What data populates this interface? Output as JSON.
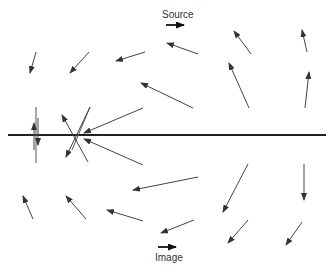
{
  "diagram": {
    "labels": {
      "source": "Source",
      "image": "Image"
    },
    "colors": {
      "line": "#222222",
      "arrow": "#444444"
    },
    "arrows": [
      {
        "name": "field-arrow-top-left-1",
        "from": [
          36,
          52
        ],
        "to": [
          30,
          73
        ]
      },
      {
        "name": "field-arrow-top-left-2",
        "from": [
          89,
          52
        ],
        "to": [
          70,
          73
        ]
      },
      {
        "name": "field-arrow-top-mid-1",
        "from": [
          145,
          52
        ],
        "to": [
          116,
          61
        ]
      },
      {
        "name": "field-arrow-top-mid-2",
        "from": [
          198,
          54
        ],
        "to": [
          167,
          43
        ]
      },
      {
        "name": "field-arrow-top-right-1",
        "from": [
          251,
          54
        ],
        "to": [
          234,
          31
        ]
      },
      {
        "name": "field-arrow-top-right-2",
        "from": [
          307,
          52
        ],
        "to": [
          302,
          30
        ]
      },
      {
        "name": "field-arrow-mid-1",
        "from": [
          193,
          108
        ],
        "to": [
          141,
          83
        ]
      },
      {
        "name": "field-arrow-mid-2",
        "from": [
          249,
          108
        ],
        "to": [
          229,
          63
        ]
      },
      {
        "name": "field-arrow-mid-3",
        "from": [
          305,
          108
        ],
        "to": [
          309,
          72
        ]
      },
      {
        "name": "field-arrow-near-line-upper",
        "from": [
          143,
          108
        ],
        "to": [
          84,
          133
        ]
      },
      {
        "name": "field-arrow-near-line-lower",
        "from": [
          143,
          165
        ],
        "to": [
          84,
          139
        ]
      },
      {
        "name": "field-arrow-low-mid-1",
        "from": [
          198,
          177
        ],
        "to": [
          133,
          190
        ]
      },
      {
        "name": "field-arrow-low-mid-2",
        "from": [
          248,
          164
        ],
        "to": [
          223,
          212
        ]
      },
      {
        "name": "field-arrow-low-right-1",
        "from": [
          304,
          164
        ],
        "to": [
          304,
          200
        ]
      },
      {
        "name": "field-arrow-bottom-left-1",
        "from": [
          33,
          219
        ],
        "to": [
          23,
          196
        ]
      },
      {
        "name": "field-arrow-bottom-left-2",
        "from": [
          86,
          219
        ],
        "to": [
          66,
          196
        ]
      },
      {
        "name": "field-arrow-bottom-mid-1",
        "from": [
          143,
          221
        ],
        "to": [
          107,
          210
        ]
      },
      {
        "name": "field-arrow-bottom-mid-2",
        "from": [
          194,
          220
        ],
        "to": [
          161,
          233
        ]
      },
      {
        "name": "field-arrow-bottom-right-1",
        "from": [
          248,
          220
        ],
        "to": [
          228,
          243
        ]
      },
      {
        "name": "field-arrow-bottom-right-2",
        "from": [
          302,
          222
        ],
        "to": [
          286,
          245
        ]
      },
      {
        "name": "cross-arrow-1",
        "from": [
          88,
          162
        ],
        "to": [
          62,
          115
        ]
      },
      {
        "name": "cross-arrow-2",
        "from": [
          90,
          107
        ],
        "to": [
          66,
          157
        ]
      },
      {
        "name": "vertical-arrow-up",
        "from": [
          34,
          150
        ],
        "to": [
          34,
          123
        ]
      },
      {
        "name": "vertical-arrow-down",
        "from": [
          38,
          118
        ],
        "to": [
          38,
          145
        ]
      }
    ],
    "source_arrow": {
      "from": [
        166,
        25
      ],
      "to": [
        184,
        25
      ]
    },
    "image_arrow": {
      "from": [
        158,
        247
      ],
      "to": [
        176,
        247
      ]
    }
  }
}
